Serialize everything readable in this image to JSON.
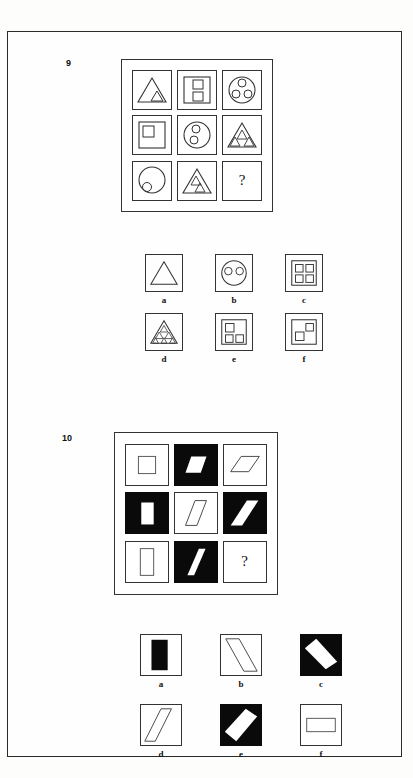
{
  "page": {
    "background": "#fdfdfc",
    "border_color": "#2a2a2a",
    "ink": "#111111",
    "fill_black": "#0a0a0a"
  },
  "puzzles": [
    {
      "number": "9",
      "question_mark": "?",
      "matrix": {
        "rows": [
          [
            {
              "name": "triangle-with-1-triangle",
              "outer": "square-frame",
              "shape": "triangle",
              "inner_count": 1,
              "inner_shape": "triangle"
            },
            {
              "name": "square-with-2-squares",
              "outer": "square-frame",
              "shape": "square",
              "inner_count": 2,
              "inner_shape": "square"
            },
            {
              "name": "circle-with-3-circles",
              "outer": "square-frame",
              "shape": "circle",
              "inner_count": 3,
              "inner_shape": "circle"
            }
          ],
          [
            {
              "name": "square-with-1-square",
              "outer": "square-frame",
              "shape": "square",
              "inner_count": 1,
              "inner_shape": "square"
            },
            {
              "name": "circle-with-2-circles",
              "outer": "square-frame",
              "shape": "circle",
              "inner_count": 2,
              "inner_shape": "circle"
            },
            {
              "name": "triangle-with-3-triangles",
              "outer": "square-frame",
              "shape": "triangle",
              "inner_count": 3,
              "inner_shape": "triangle"
            }
          ],
          [
            {
              "name": "circle-with-1-circle",
              "outer": "square-frame",
              "shape": "circle",
              "inner_count": 1,
              "inner_shape": "circle"
            },
            {
              "name": "triangle-with-2-triangles",
              "outer": "square-frame",
              "shape": "triangle",
              "inner_count": 2,
              "inner_shape": "triangle"
            },
            {
              "name": "missing-cell",
              "outer": "square-frame",
              "shape": "question-mark",
              "inner_count": 0,
              "inner_shape": ""
            }
          ]
        ]
      },
      "options": [
        {
          "label": "a",
          "name": "option-a-triangle-empty",
          "shape": "triangle",
          "inner_count": 0
        },
        {
          "label": "b",
          "name": "option-b-circle-2-circles",
          "shape": "circle",
          "inner_count": 2
        },
        {
          "label": "c",
          "name": "option-c-square-4-squares",
          "shape": "square",
          "inner_count": 4
        },
        {
          "label": "d",
          "name": "option-d-triangle-many-triangles",
          "shape": "triangle",
          "inner_count": 6
        },
        {
          "label": "e",
          "name": "option-e-square-3-squares",
          "shape": "square",
          "inner_count": 3
        },
        {
          "label": "f",
          "name": "option-f-square-2-squares",
          "shape": "square",
          "inner_count": 2
        }
      ]
    },
    {
      "number": "10",
      "question_mark": "?",
      "matrix": {
        "rows": [
          [
            {
              "name": "white-tile-square-outline",
              "bg": "white",
              "shape": "square",
              "shape_fill": "white"
            },
            {
              "name": "black-tile-white-parallelogram",
              "bg": "black",
              "shape": "parallelogram-right",
              "shape_fill": "white"
            },
            {
              "name": "white-tile-flat-parallelogram-outline",
              "bg": "white",
              "shape": "parallelogram-flat",
              "shape_fill": "white"
            }
          ],
          [
            {
              "name": "black-tile-white-vertical-rectangle",
              "bg": "black",
              "shape": "rect-vertical",
              "shape_fill": "white"
            },
            {
              "name": "white-tile-parallelogram-outline",
              "bg": "white",
              "shape": "parallelogram-slant",
              "shape_fill": "white"
            },
            {
              "name": "black-tile-white-slanted-band",
              "bg": "black",
              "shape": "parallelogram-diagonal",
              "shape_fill": "white"
            }
          ],
          [
            {
              "name": "white-tile-vertical-rectangle-outline",
              "bg": "white",
              "shape": "rect-vertical",
              "shape_fill": "white"
            },
            {
              "name": "black-tile-white-steep-parallelogram",
              "bg": "black",
              "shape": "parallelogram-steep",
              "shape_fill": "white"
            },
            {
              "name": "missing-cell",
              "bg": "white",
              "shape": "question-mark",
              "shape_fill": ""
            }
          ]
        ]
      },
      "options": [
        {
          "label": "a",
          "name": "option-a-white-tile-black-bar",
          "bg": "white",
          "shape": "rect-vertical",
          "shape_fill": "black"
        },
        {
          "label": "b",
          "name": "option-b-white-tile-diagonal-outline",
          "bg": "white",
          "shape": "diagonal-band",
          "shape_fill": "white"
        },
        {
          "label": "c",
          "name": "option-c-black-tile-white-diagonal",
          "bg": "black",
          "shape": "diagonal-band",
          "shape_fill": "white"
        },
        {
          "label": "d",
          "name": "option-d-white-tile-narrow-diagonal",
          "bg": "white",
          "shape": "diagonal-band-narrow",
          "shape_fill": "white"
        },
        {
          "label": "e",
          "name": "option-e-black-tile-white-diagonal",
          "bg": "black",
          "shape": "diagonal-band",
          "shape_fill": "white"
        },
        {
          "label": "f",
          "name": "option-f-white-tile-horizontal-rect",
          "bg": "white",
          "shape": "rect-horizontal",
          "shape_fill": "white"
        }
      ]
    }
  ]
}
